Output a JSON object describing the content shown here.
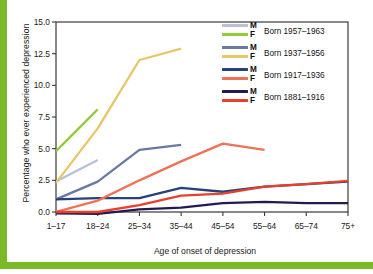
{
  "figure": {
    "accent_color": "#7cb928",
    "background": "#ffffff",
    "axis_color": "#3a3a3a"
  },
  "chart_data": {
    "type": "line",
    "title": "",
    "xlabel": "Age of onset of depression",
    "ylabel": "Percentage who ever experienced depression",
    "categories": [
      "1–17",
      "18–24",
      "25–34",
      "35–44",
      "45–54",
      "55–64",
      "65–74",
      "75+"
    ],
    "ylim": [
      0.0,
      15.0
    ],
    "yticks": [
      "0.0",
      "2.5",
      "5.0",
      "7.5",
      "10.0",
      "12.5",
      "15.0"
    ],
    "ytick_values": [
      0.0,
      2.5,
      5.0,
      7.5,
      10.0,
      12.5,
      15.0
    ],
    "grid": false,
    "legend_position": "upper right",
    "series": [
      {
        "name": "Born 1957–1963 M",
        "sex": "M",
        "cohort": "Born 1957–1963",
        "color": "#b9bfd6",
        "values": [
          2.4,
          4.1,
          null,
          null,
          null,
          null,
          null,
          null
        ]
      },
      {
        "name": "Born 1957–1963 F",
        "sex": "F",
        "cohort": "Born 1957–1963",
        "color": "#95c93d",
        "values": [
          4.8,
          8.1,
          null,
          null,
          null,
          null,
          null,
          null
        ]
      },
      {
        "name": "Born 1937–1956 M",
        "sex": "M",
        "cohort": "Born 1937–1956",
        "color": "#6a79a4",
        "values": [
          1.0,
          2.4,
          4.9,
          5.3,
          null,
          null,
          null,
          null
        ]
      },
      {
        "name": "Born 1937–1956 F",
        "sex": "F",
        "cohort": "Born 1937–1956",
        "color": "#e8c567",
        "values": [
          2.3,
          6.6,
          12.0,
          12.9,
          null,
          null,
          null,
          null
        ]
      },
      {
        "name": "Born 1917–1936 M",
        "sex": "M",
        "cohort": "Born 1917–1936",
        "color": "#27417c",
        "values": [
          1.0,
          1.1,
          1.1,
          1.9,
          1.6,
          2.0,
          2.2,
          2.4
        ]
      },
      {
        "name": "Born 1917–1936 F",
        "sex": "F",
        "cohort": "Born 1917–1936",
        "color": "#ef7256",
        "values": [
          0.0,
          0.9,
          2.5,
          4.0,
          5.4,
          4.9,
          null,
          null
        ]
      },
      {
        "name": "Born 1881–1916 M",
        "sex": "M",
        "cohort": "Born 1881–1916",
        "color": "#241a52",
        "values": [
          -0.1,
          -0.15,
          0.2,
          0.35,
          0.7,
          0.8,
          0.7,
          0.7
        ]
      },
      {
        "name": "Born 1881–1916 F",
        "sex": "F",
        "cohort": "Born 1881–1916",
        "color": "#e8402a",
        "values": [
          0.0,
          0.0,
          0.55,
          1.3,
          1.45,
          2.0,
          2.2,
          2.45
        ]
      }
    ]
  },
  "legend": {
    "groups": [
      {
        "cohort_label": "Born 1957–1963",
        "male_label": "M",
        "female_label": "F",
        "male_color": "#b9bfd6",
        "female_color": "#95c93d"
      },
      {
        "cohort_label": "Born 1937–1956",
        "male_label": "M",
        "female_label": "F",
        "male_color": "#6a79a4",
        "female_color": "#e8c567"
      },
      {
        "cohort_label": "Born 1917–1936",
        "male_label": "M",
        "female_label": "F",
        "male_color": "#27417c",
        "female_color": "#ef7256"
      },
      {
        "cohort_label": "Born 1881–1916",
        "male_label": "M",
        "female_label": "F",
        "male_color": "#241a52",
        "female_color": "#e8402a"
      }
    ]
  }
}
